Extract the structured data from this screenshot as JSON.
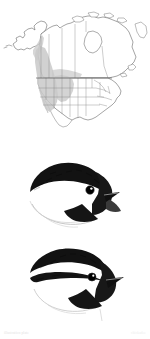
{
  "page": {
    "background_color": "#ffffff"
  },
  "map": {
    "name": "north-america-range-map",
    "region": "North America",
    "outline_color": "#555555",
    "border_color": "#777777",
    "range_fill_color": "#c9c9c9",
    "range_description": "Shaded band through western mountains from British Columbia south through the Rockies and Great Basin",
    "legend_label": "Range"
  },
  "illustrations": [
    {
      "name": "black-capped-chickadee-head",
      "label": "Black-capped Chickadee",
      "features": "solid black cap, white cheek, black bib, gray wing",
      "cap_color": "#111111",
      "cheek_color": "#ffffff",
      "bib_color": "#151515",
      "eye_color": "#000000"
    },
    {
      "name": "mountain-chickadee-head",
      "label": "Mountain Chickadee",
      "features": "black cap split by white eyebrow stripe, white cheek, black bib",
      "cap_color": "#111111",
      "eyebrow_color": "#ffffff",
      "cheek_color": "#ffffff",
      "bib_color": "#151515",
      "eye_color": "#000000"
    }
  ],
  "caption": {
    "left": "illustration plate",
    "right": "chickadee"
  }
}
